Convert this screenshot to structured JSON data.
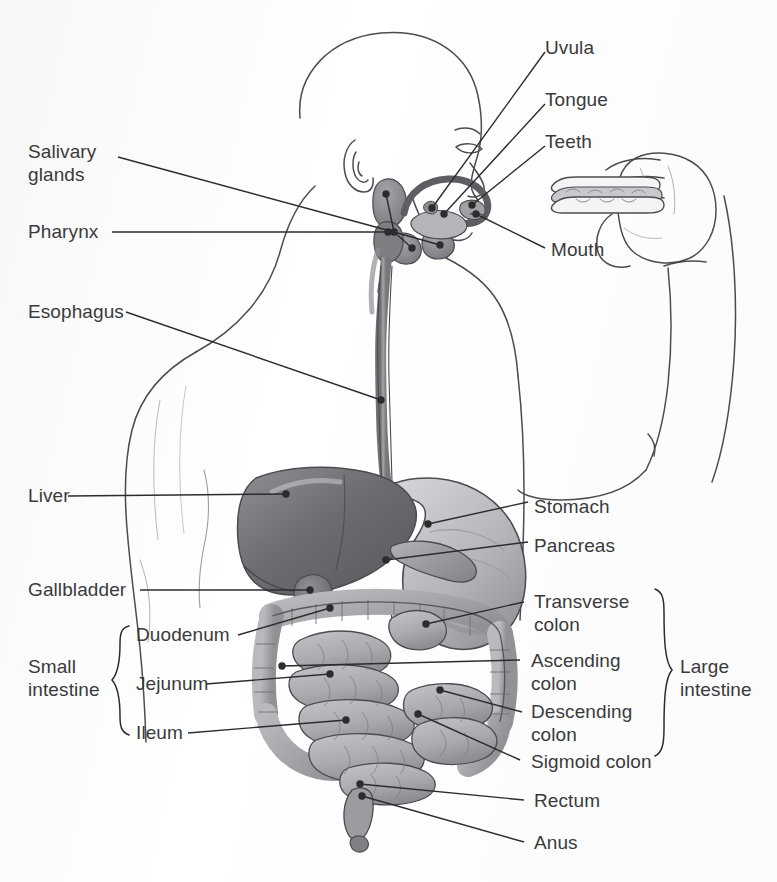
{
  "figure": {
    "background_color": "#fdfdfd",
    "text_color": "#3a3a3c",
    "leader_line_color": "#2c2c2e"
  },
  "labels": {
    "uvula": "Uvula",
    "tongue": "Tongue",
    "teeth": "Teeth",
    "mouth": "Mouth",
    "salivary_glands_line1": "Salivary",
    "salivary_glands_line2": "glands",
    "pharynx": "Pharynx",
    "esophagus": "Esophagus",
    "liver": "Liver",
    "gallbladder": "Gallbladder",
    "stomach": "Stomach",
    "pancreas": "Pancreas",
    "transverse_colon_line1": "Transverse",
    "transverse_colon_line2": "colon",
    "ascending_colon_line1": "Ascending",
    "ascending_colon_line2": "colon",
    "descending_colon_line1": "Descending",
    "descending_colon_line2": "colon",
    "sigmoid_colon": "Sigmoid colon",
    "rectum": "Rectum",
    "anus": "Anus",
    "duodenum": "Duodenum",
    "jejunum": "Jejunum",
    "ileum": "Ileum",
    "small_intestine_line1": "Small",
    "small_intestine_line2": "intestine",
    "large_intestine_line1": "Large",
    "large_intestine_line2": "intestine"
  },
  "groups": {
    "small_intestine": {
      "label": "Small intestine",
      "members": [
        "Duodenum",
        "Jejunum",
        "Ileum"
      ],
      "brace_side": "right-facing"
    },
    "large_intestine": {
      "label": "Large intestine",
      "members": [
        "Transverse colon",
        "Ascending colon",
        "Descending colon",
        "Sigmoid colon"
      ],
      "brace_side": "left-facing"
    }
  },
  "organs": [
    {
      "name": "salivary-glands",
      "tone": "#8f9194"
    },
    {
      "name": "pharynx",
      "tone": "#7e8084"
    },
    {
      "name": "tongue",
      "tone": "#a9abae"
    },
    {
      "name": "teeth",
      "tone": "#9a9ca0"
    },
    {
      "name": "esophagus",
      "tone": "#8a8c90"
    },
    {
      "name": "liver",
      "tone": "#6f7174"
    },
    {
      "name": "gallbladder",
      "tone": "#7a7c80"
    },
    {
      "name": "stomach",
      "tone": "#b9bbbe"
    },
    {
      "name": "pancreas",
      "tone": "#9b9da0"
    },
    {
      "name": "small-intestine",
      "tone": "#b2b4b7"
    },
    {
      "name": "large-intestine",
      "tone": "#a6a8ab"
    },
    {
      "name": "rectum",
      "tone": "#989a9d"
    }
  ],
  "figure_elements": [
    {
      "name": "head-profile"
    },
    {
      "name": "ear"
    },
    {
      "name": "neck"
    },
    {
      "name": "torso-back"
    },
    {
      "name": "arm"
    },
    {
      "name": "hand"
    },
    {
      "name": "sandwich"
    }
  ]
}
